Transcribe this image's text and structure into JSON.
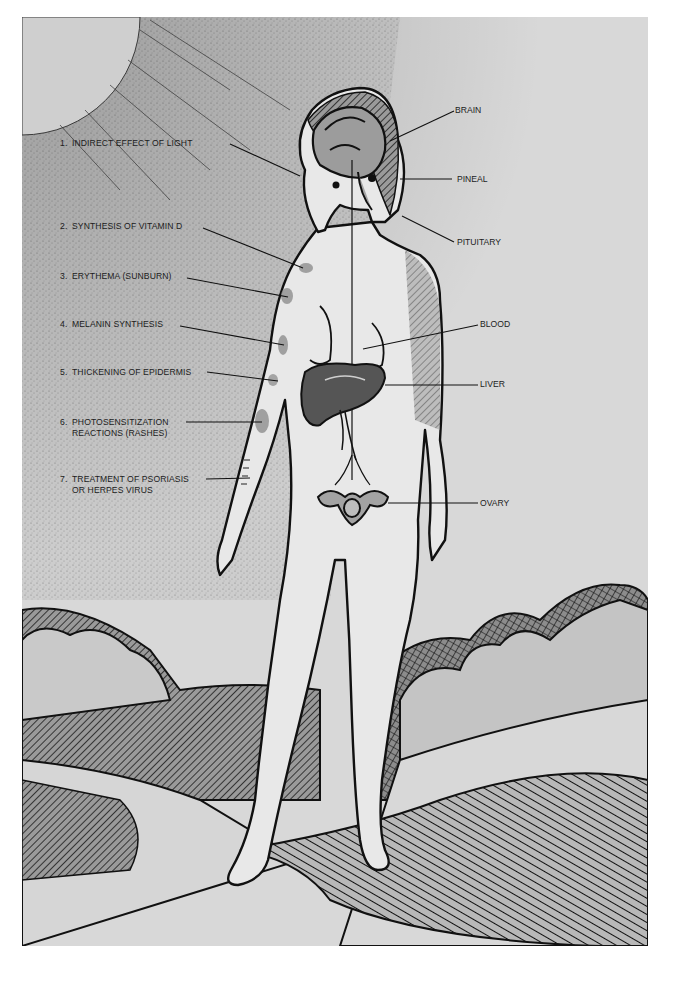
{
  "figure": {
    "colors": {
      "paper": "#d9d9d9",
      "sky_stipple": "#bdbdbd",
      "sun": "#cfcfcf",
      "ink": "#111111",
      "skin": "#e6e6e6",
      "organ_light": "#9a9a9a",
      "organ_dark": "#555555",
      "ground": "#dcdcdc"
    }
  },
  "left_labels": [
    {
      "num": "1.",
      "text": "INDIRECT EFFECT OF LIGHT",
      "text2": "",
      "x": 60,
      "y": 138,
      "line": [
        230,
        144,
        300,
        176
      ]
    },
    {
      "num": "2.",
      "text": "SYNTHESIS OF VITAMIN D",
      "text2": "",
      "x": 60,
      "y": 221,
      "line": [
        203,
        228,
        303,
        268
      ]
    },
    {
      "num": "3.",
      "text": "ERYTHEMA (SUNBURN)",
      "text2": "",
      "x": 60,
      "y": 271,
      "line": [
        187,
        278,
        288,
        297
      ]
    },
    {
      "num": "4.",
      "text": "MELANIN SYNTHESIS",
      "text2": "",
      "x": 60,
      "y": 319,
      "line": [
        180,
        326,
        284,
        345
      ]
    },
    {
      "num": "5.",
      "text": "THICKENING OF EPIDERMIS",
      "text2": "",
      "x": 60,
      "y": 367,
      "line": [
        207,
        372,
        278,
        381
      ]
    },
    {
      "num": "6.",
      "text": "PHOTOSENSITIZATION",
      "text2": "REACTIONS (RASHES)",
      "x": 60,
      "y": 417,
      "line": [
        186,
        422,
        262,
        422
      ]
    },
    {
      "num": "7.",
      "text": "TREATMENT OF PSORIASIS",
      "text2": "OR HERPES VIRUS",
      "x": 60,
      "y": 474,
      "line": [
        206,
        479,
        250,
        478
      ]
    }
  ],
  "right_labels": [
    {
      "text": "BRAIN",
      "x": 455,
      "y": 105,
      "line": [
        454,
        111,
        390,
        141
      ]
    },
    {
      "text": "PINEAL",
      "x": 457,
      "y": 174,
      "line": [
        452,
        179,
        400,
        179
      ]
    },
    {
      "text": "PITUITARY",
      "x": 457,
      "y": 237,
      "line": [
        454,
        242,
        402,
        216
      ]
    },
    {
      "text": "BLOOD",
      "x": 480,
      "y": 319,
      "line": [
        478,
        325,
        363,
        349
      ]
    },
    {
      "text": "LIVER",
      "x": 480,
      "y": 379,
      "line": [
        478,
        385,
        385,
        385
      ]
    },
    {
      "text": "OVARY",
      "x": 480,
      "y": 498,
      "line": [
        478,
        503,
        388,
        503
      ]
    }
  ]
}
